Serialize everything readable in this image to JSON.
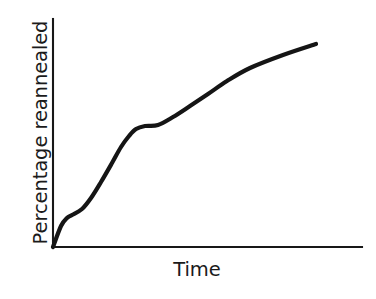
{
  "figure": {
    "kind": "schematic-line-plot",
    "background_color": "#ffffff",
    "line_color": "#151515",
    "axis_color": "#181818"
  },
  "chart_data": {
    "type": "line",
    "title": "",
    "subtitle": "",
    "xlabel": "Time",
    "ylabel": "Percentage reannealed",
    "grid": false,
    "legend": null,
    "xlim": [
      0,
      100
    ],
    "ylim": [
      0,
      100
    ],
    "x_tick_labels": [],
    "y_tick_labels": [],
    "annotations": [],
    "axes": {
      "x_axis_from_px": [
        53,
        247
      ],
      "x_axis_to_px": [
        362,
        247
      ],
      "y_axis_from_px": [
        53,
        247
      ],
      "y_axis_to_px": [
        53,
        19
      ]
    },
    "series": [
      {
        "name": "Reannealing progress",
        "x": [
          0,
          4,
          6,
          9,
          13,
          18,
          23,
          27,
          30,
          33,
          36,
          40,
          45,
          52,
          60,
          68,
          76,
          84,
          92,
          100
        ],
        "y": [
          0,
          9,
          13,
          14,
          17,
          22,
          28,
          36,
          44,
          50,
          53,
          54,
          55,
          58,
          63,
          68,
          74,
          80,
          85,
          89
        ],
        "points_px": [
          [
            53,
            247
          ],
          [
            61,
            226
          ],
          [
            67,
            218
          ],
          [
            72,
            215
          ],
          [
            82,
            209
          ],
          [
            91,
            198
          ],
          [
            101,
            182
          ],
          [
            112,
            163
          ],
          [
            121,
            147
          ],
          [
            129,
            136
          ],
          [
            136,
            129
          ],
          [
            145,
            126
          ],
          [
            158,
            125
          ],
          [
            173,
            117
          ],
          [
            190,
            106
          ],
          [
            208,
            94
          ],
          [
            227,
            81
          ],
          [
            250,
            68
          ],
          [
            283,
            55
          ],
          [
            316,
            44
          ]
        ]
      }
    ]
  },
  "labels": {
    "y_axis": "Percentage reannealed",
    "x_axis": "Time"
  }
}
